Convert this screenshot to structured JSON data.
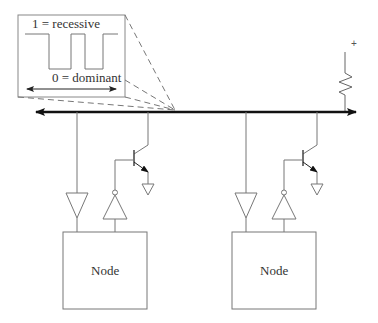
{
  "diagram": {
    "inset": {
      "recessive_label": "1 = recessive",
      "dominant_label": "0 = dominant"
    },
    "pullup": {
      "supply_label": "+"
    },
    "nodes": [
      {
        "label": "Node"
      },
      {
        "label": "Node"
      }
    ],
    "colors": {
      "line": "#777777",
      "bus": "#111111",
      "text": "#333333"
    }
  }
}
